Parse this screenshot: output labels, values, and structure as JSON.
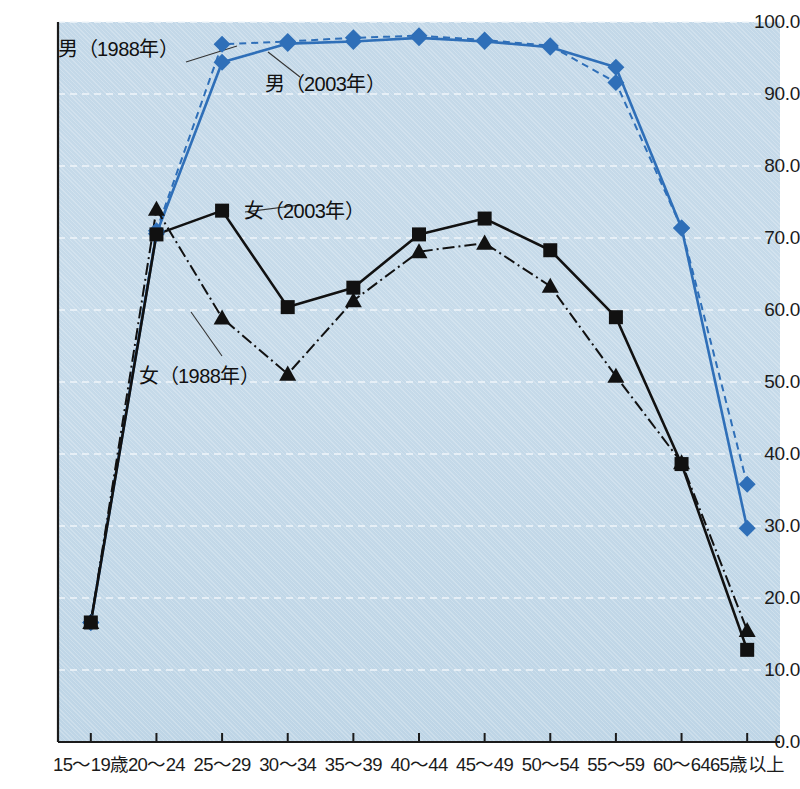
{
  "chart_data": {
    "type": "line",
    "title": "",
    "xlabel": "",
    "ylabel": "",
    "ylim": [
      0.0,
      100.0
    ],
    "ytick_step": 10.0,
    "grid": true,
    "legend_position": "inline-annotations",
    "categories": [
      "15～19歳",
      "20～24",
      "25～29",
      "30～34",
      "35～39",
      "40～44",
      "45～49",
      "50～54",
      "55～59",
      "60～64",
      "65歳以上"
    ],
    "ytick_labels": [
      "100.0",
      "90.0",
      "80.0",
      "70.0",
      "60.0",
      "50.0",
      "40.0",
      "30.0",
      "20.0",
      "10.0",
      "0.0"
    ],
    "ytick_values": [
      100.0,
      90.0,
      80.0,
      70.0,
      60.0,
      50.0,
      40.0,
      30.0,
      20.0,
      10.0,
      0.0
    ],
    "series": [
      {
        "name": "男（1988年）",
        "key": "male_1988",
        "color": "#2f6fb8",
        "marker": "diamond",
        "line_style": "dashed",
        "values": [
          16.6,
          71.0,
          96.9,
          97.3,
          97.8,
          98.1,
          97.5,
          96.7,
          91.6,
          71.4,
          35.8
        ]
      },
      {
        "name": "男（2003年）",
        "key": "male_2003",
        "color": "#2f6fb8",
        "marker": "diamond",
        "line_style": "solid",
        "values": [
          16.6,
          70.6,
          94.4,
          97.0,
          97.3,
          97.8,
          97.3,
          96.5,
          93.7,
          71.4,
          29.7
        ]
      },
      {
        "name": "女（1988年）",
        "key": "female_1988",
        "color": "#111111",
        "marker": "triangle",
        "line_style": "dashdot",
        "values": [
          16.6,
          74.0,
          58.9,
          51.1,
          61.3,
          68.1,
          69.3,
          63.3,
          50.8,
          38.8,
          15.5
        ]
      },
      {
        "name": "女（2003年）",
        "key": "female_2003",
        "color": "#111111",
        "marker": "square",
        "line_style": "solid",
        "values": [
          16.6,
          70.5,
          73.8,
          60.4,
          63.1,
          70.5,
          72.7,
          68.3,
          59.0,
          38.6,
          12.8
        ]
      }
    ],
    "annotations": [
      {
        "id": "annot-male-1988",
        "text": "男（1988年）"
      },
      {
        "id": "annot-male-2003",
        "text": "男（2003年）"
      },
      {
        "id": "annot-female-2003",
        "text": "女（2003年）"
      },
      {
        "id": "annot-female-1988",
        "text": "女（1988年）"
      }
    ]
  },
  "colors": {
    "male": "#2f6fb8",
    "female": "#111111",
    "plot_background": "#c3d8e8",
    "gridline": "#f2f7fb",
    "axis": "#1b1b1b",
    "page_background": "#ffffff"
  }
}
